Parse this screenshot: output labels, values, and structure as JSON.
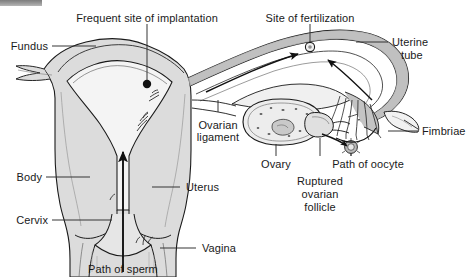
{
  "figure": {
    "type": "anatomical-diagram",
    "background_color": "#ffffff",
    "line_color": "#1a1a1a",
    "tissue_fill": "#d9d9d9",
    "tissue_fill_light": "#eeeeee",
    "tube_fill": "#a8a8a8"
  },
  "corner_bar": {
    "color": "#8c8c8c"
  },
  "labels": {
    "frequent_site_of_implantation": "Frequent site of implantation",
    "fundus": "Fundus",
    "site_of_fertilization": "Site of fertilization",
    "uterine_tube_line1": "Uterine",
    "uterine_tube_line2": "tube",
    "fimbriae": "Fimbriae",
    "ovarian_ligament_line1": "Ovarian",
    "ovarian_ligament_line2": "ligament",
    "ovary": "Ovary",
    "path_of_oocyte": "Path of oocyte",
    "ruptured_ovarian_follicle_line1": "Ruptured",
    "ruptured_ovarian_follicle_line2": "ovarian",
    "ruptured_ovarian_follicle_line3": "follicle",
    "body": "Body",
    "uterus": "Uterus",
    "cervix": "Cervix",
    "vagina": "Vagina",
    "path_of_sperm": "Path of sperm"
  }
}
